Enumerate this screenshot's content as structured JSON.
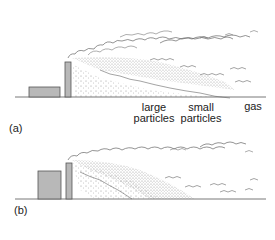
{
  "diagram": {
    "panels": [
      {
        "id": "a",
        "label": "(a)",
        "description": "Smokestack plume with particle fallout under unstable conditions",
        "zones": [
          {
            "line1": "large",
            "line2": "particles"
          },
          {
            "line1": "small",
            "line2": "particles"
          },
          {
            "line1": "gas",
            "line2": ""
          }
        ]
      },
      {
        "id": "b",
        "label": "(b)",
        "description": "Smokestack plume with taller building, particles fall closer to source"
      }
    ],
    "colors": {
      "building_fill": "#b8b8b8",
      "outline": "#555555",
      "stipple": "#666666"
    }
  }
}
